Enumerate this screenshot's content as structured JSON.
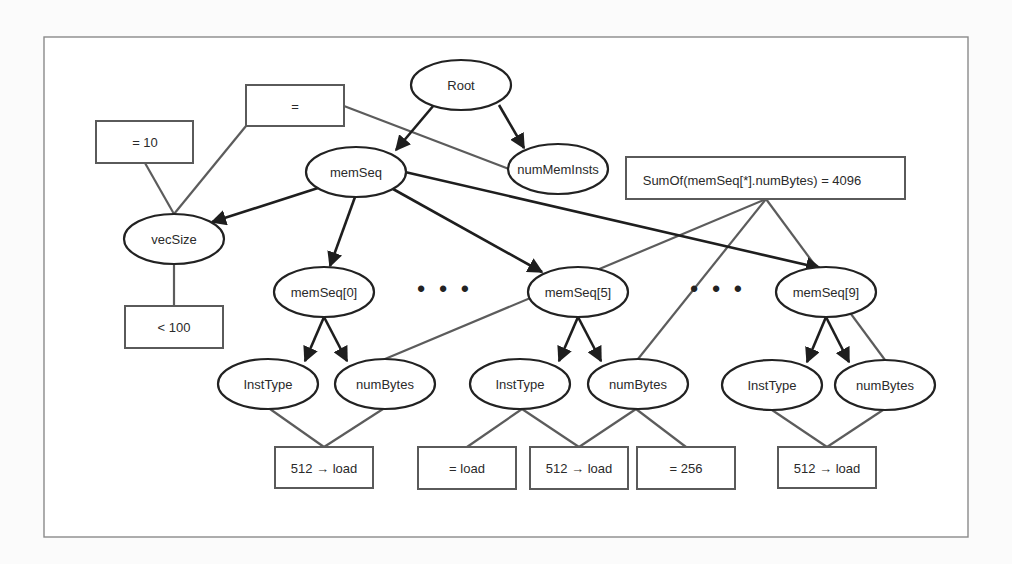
{
  "diagram": {
    "type": "tree-with-constraints",
    "nodes": {
      "root": {
        "label": "Root"
      },
      "memSeq": {
        "label": "memSeq"
      },
      "numMemInsts": {
        "label": "numMemInsts"
      },
      "vecSize": {
        "label": "vecSize"
      },
      "memSeq0": {
        "label": "memSeq[0]"
      },
      "memSeq5": {
        "label": "memSeq[5]"
      },
      "memSeq9": {
        "label": "memSeq[9]"
      },
      "instType0": {
        "label": "InstType"
      },
      "numBytes0": {
        "label": "numBytes"
      },
      "instType5": {
        "label": "InstType"
      },
      "numBytes5": {
        "label": "numBytes"
      },
      "instType9": {
        "label": "InstType"
      },
      "numBytes9": {
        "label": "numBytes"
      }
    },
    "constraints": {
      "eq": {
        "label": "="
      },
      "eq10": {
        "label": "= 10"
      },
      "lt100": {
        "label": "< 100"
      },
      "sumOf": {
        "label": "SumOf(memSeq[*].numBytes)  = 4096"
      },
      "impl0": {
        "label": "512 → load"
      },
      "eqLoad": {
        "label": "= load"
      },
      "impl5": {
        "label": "512 → load"
      },
      "eq256": {
        "label": "= 256"
      },
      "impl9": {
        "label": "512 → load"
      }
    },
    "ellipses": {
      "between_0_5": "• • •",
      "between_5_9": "• • •"
    },
    "edges_tree": [
      [
        "Root",
        "memSeq"
      ],
      [
        "Root",
        "numMemInsts"
      ],
      [
        "memSeq",
        "vecSize"
      ],
      [
        "memSeq",
        "memSeq[0]"
      ],
      [
        "memSeq",
        "memSeq[5]"
      ],
      [
        "memSeq",
        "memSeq[9]"
      ],
      [
        "memSeq[0]",
        "InstType"
      ],
      [
        "memSeq[0]",
        "numBytes"
      ],
      [
        "memSeq[5]",
        "InstType"
      ],
      [
        "memSeq[5]",
        "numBytes"
      ],
      [
        "memSeq[9]",
        "InstType"
      ],
      [
        "memSeq[9]",
        "numBytes"
      ]
    ],
    "edges_constraint": [
      [
        "=",
        "vecSize"
      ],
      [
        "=",
        "numMemInsts"
      ],
      [
        "= 10",
        "vecSize"
      ],
      [
        "vecSize",
        "< 100"
      ],
      [
        "SumOf",
        "memSeq[0].numBytes"
      ],
      [
        "SumOf",
        "memSeq[5].numBytes"
      ],
      [
        "SumOf",
        "memSeq[9].numBytes"
      ],
      [
        "memSeq[0].InstType",
        "512 → load"
      ],
      [
        "memSeq[0].numBytes",
        "512 → load"
      ],
      [
        "memSeq[5].InstType",
        "= load"
      ],
      [
        "memSeq[5].InstType",
        "512 → load"
      ],
      [
        "memSeq[5].numBytes",
        "512 → load"
      ],
      [
        "memSeq[5].numBytes",
        "= 256"
      ],
      [
        "memSeq[9].InstType",
        "512 → load"
      ],
      [
        "memSeq[9].numBytes",
        "512 → load"
      ]
    ],
    "colors": {
      "tree_edge": "#1e1e1e",
      "constraint_edge": "#5c5c5c",
      "frame": "#8a8a8a"
    }
  }
}
